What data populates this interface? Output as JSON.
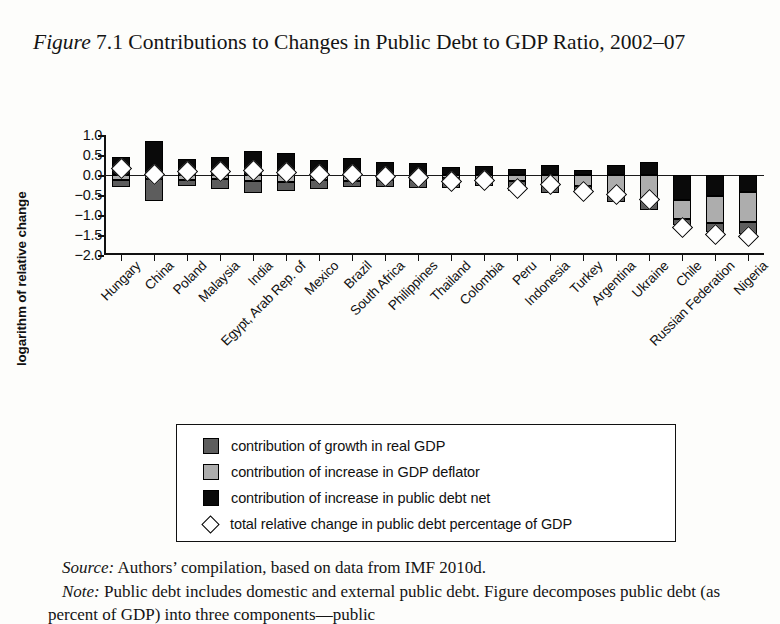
{
  "figure": {
    "label": "Figure",
    "number": "7.1",
    "title": "Contributions to Changes in Public Debt to GDP Ratio, 2002–07"
  },
  "source": {
    "label": "Source:",
    "text": "Authors’ compilation, based on data from IMF 2010d."
  },
  "note": {
    "label": "Note:",
    "text": "Public debt includes domestic and external public debt. Figure decomposes public debt (as percent of GDP) into three components—public"
  },
  "legend": {
    "items": [
      {
        "swatch": "growth",
        "icon": "dark-gray-square-icon",
        "label": "contribution of growth in real GDP"
      },
      {
        "swatch": "deflator",
        "icon": "light-gray-square-icon",
        "label": "contribution of increase in GDP deflator"
      },
      {
        "swatch": "debtnet",
        "icon": "black-square-icon",
        "label": "contribution of increase in public debt net"
      },
      {
        "swatch": "diamond",
        "icon": "white-diamond-icon",
        "label": "total relative change in public debt percentage of GDP"
      }
    ]
  },
  "colors": {
    "growth": "#5d5d5d",
    "deflator": "#adadad",
    "debtnet": "#0a0a0a",
    "diamond_fill": "#ffffff",
    "axis": "#111111",
    "page_background": "#fdfdfb"
  },
  "chart_data": {
    "type": "bar",
    "subtype": "stacked-bar-with-marker",
    "title": "Figure 7.1 Contributions to Changes in Public Debt to GDP Ratio, 2002–07",
    "xlabel": "",
    "ylabel": "logarithm of relative change",
    "ylim": [
      -2.0,
      1.0
    ],
    "yticks": [
      1.0,
      0.5,
      0.0,
      -0.5,
      -1.0,
      -1.5,
      -2.0
    ],
    "ytick_labels": [
      "1.0",
      "0.5",
      "0.0",
      "−0.5",
      "−1.0",
      "−1.5",
      "−2.0"
    ],
    "grid": false,
    "legend_position": "below-plot",
    "categories": [
      "Hungary",
      "China",
      "Poland",
      "Malaysia",
      "India",
      "Egypt, Arab Rep. of",
      "Mexico",
      "Brazil",
      "South Africa",
      "Philippines",
      "Thailand",
      "Colombia",
      "Peru",
      "Indonesia",
      "Turkey",
      "Argentina",
      "Ukraine",
      "Chile",
      "Russian Federation",
      "Nigeria"
    ],
    "series": [
      {
        "name": "contribution of increase in public debt net",
        "key": "debtnet",
        "color": "#0a0a0a",
        "values": [
          0.45,
          0.85,
          0.4,
          0.45,
          0.6,
          0.55,
          0.38,
          0.42,
          0.32,
          0.3,
          0.2,
          0.22,
          0.14,
          0.26,
          0.12,
          0.26,
          0.33,
          -0.62,
          -0.52,
          -0.42
        ]
      },
      {
        "name": "contribution of increase in GDP deflator",
        "key": "deflator",
        "color": "#adadad",
        "values": [
          -0.12,
          -0.1,
          -0.13,
          -0.1,
          -0.15,
          -0.17,
          -0.13,
          -0.15,
          -0.12,
          -0.12,
          -0.08,
          -0.14,
          -0.14,
          -0.25,
          -0.28,
          -0.48,
          -0.66,
          -0.47,
          -0.68,
          -0.76
        ]
      },
      {
        "name": "contribution of growth in real GDP",
        "key": "growth",
        "color": "#5d5d5d",
        "values": [
          -0.17,
          -0.55,
          -0.14,
          -0.25,
          -0.3,
          -0.22,
          -0.22,
          -0.14,
          -0.18,
          -0.2,
          -0.24,
          -0.14,
          -0.26,
          -0.2,
          -0.18,
          -0.2,
          -0.22,
          -0.16,
          -0.22,
          -0.3
        ]
      }
    ],
    "marker_series": {
      "name": "total relative change in public debt percentage of GDP",
      "key": "total",
      "marker": "white-diamond",
      "values": [
        0.2,
        0.05,
        0.12,
        0.12,
        0.13,
        0.08,
        0.03,
        0.05,
        0.0,
        -0.04,
        -0.14,
        -0.1,
        -0.3,
        -0.22,
        -0.38,
        -0.46,
        -0.58,
        -1.28,
        -1.45,
        -1.52
      ]
    }
  }
}
